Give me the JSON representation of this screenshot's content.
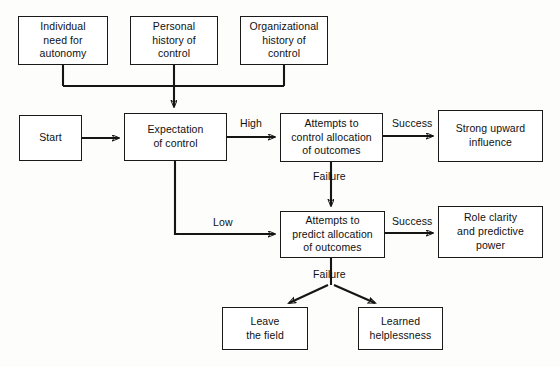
{
  "diagram": {
    "background_color": "#fdfdfc",
    "line_color": "#151515",
    "box_border_color": "#1a1a1a",
    "text_color": "#101010"
  },
  "nodes": [
    {
      "id": "individual-need-autonomy",
      "label": "Individual\nneed for\nautonomy",
      "x": 18,
      "y": 16,
      "w": 90,
      "h": 49,
      "font_size": 10.5
    },
    {
      "id": "personal-history-control",
      "label": "Personal\nhistory of\ncontrol",
      "x": 130,
      "y": 16,
      "w": 88,
      "h": 49,
      "font_size": 10.5
    },
    {
      "id": "organizational-history-control",
      "label": "Organizational\nhistory of\ncontrol",
      "x": 240,
      "y": 16,
      "w": 88,
      "h": 49,
      "font_size": 10.5
    },
    {
      "id": "start",
      "label": "Start",
      "x": 19,
      "y": 115,
      "w": 63,
      "h": 46,
      "font_size": 10.5
    },
    {
      "id": "expectation-of-control",
      "label": "Expectation\nof control",
      "x": 124,
      "y": 113,
      "w": 103,
      "h": 48,
      "font_size": 10.5
    },
    {
      "id": "attempts-control-allocation",
      "label": "Attempts to\ncontrol allocation\nof outcomes",
      "x": 280,
      "y": 113,
      "w": 103,
      "h": 49,
      "font_size": 10.5
    },
    {
      "id": "strong-upward-influence",
      "label": "Strong upward\ninfluence",
      "x": 438,
      "y": 110,
      "w": 105,
      "h": 52,
      "font_size": 10.5
    },
    {
      "id": "attempts-predict-allocation",
      "label": "Attempts to\npredict allocation\nof outcomes",
      "x": 280,
      "y": 211,
      "w": 105,
      "h": 47,
      "font_size": 10.5
    },
    {
      "id": "role-clarity-predictive-power",
      "label": "Role clarity\nand predictive\npower",
      "x": 438,
      "y": 206,
      "w": 105,
      "h": 52,
      "font_size": 10.5
    },
    {
      "id": "leave-the-field",
      "label": "Leave\nthe field",
      "x": 222,
      "y": 307,
      "w": 86,
      "h": 43,
      "font_size": 10.5
    },
    {
      "id": "learned-helplessness",
      "label": "Learned\nhelplessness",
      "x": 358,
      "y": 307,
      "w": 85,
      "h": 43,
      "font_size": 10.5
    }
  ],
  "edge_labels": [
    {
      "id": "high",
      "text": "High",
      "x": 240,
      "y": 117,
      "font_size": 10.5
    },
    {
      "id": "success-upper",
      "text": "Success",
      "x": 392,
      "y": 117,
      "font_size": 10.5
    },
    {
      "id": "failure-upper",
      "text": "Failure",
      "x": 313,
      "y": 170,
      "font_size": 10.5
    },
    {
      "id": "low",
      "text": "Low",
      "x": 213,
      "y": 216,
      "font_size": 10.5
    },
    {
      "id": "success-lower",
      "text": "Success",
      "x": 392,
      "y": 215,
      "font_size": 10.5
    },
    {
      "id": "failure-lower",
      "text": "Failure",
      "x": 313,
      "y": 268,
      "font_size": 10.5
    }
  ],
  "connections": [
    {
      "id": "autonomy-to-bus",
      "from": "individual-need-autonomy",
      "to": "merge-bus"
    },
    {
      "id": "personal-history-to-bus",
      "from": "personal-history-control",
      "to": "merge-bus"
    },
    {
      "id": "organizational-history-to-bus",
      "from": "organizational-history-control",
      "to": "merge-bus"
    },
    {
      "id": "bus-to-expectation",
      "from": "merge-bus",
      "to": "expectation-of-control"
    },
    {
      "id": "start-to-expectation",
      "from": "start",
      "to": "expectation-of-control"
    },
    {
      "id": "expectation-to-control-high",
      "from": "expectation-of-control",
      "to": "attempts-control-allocation",
      "label": "High"
    },
    {
      "id": "control-to-influence-success",
      "from": "attempts-control-allocation",
      "to": "strong-upward-influence",
      "label": "Success"
    },
    {
      "id": "control-to-predict-failure",
      "from": "attempts-control-allocation",
      "to": "attempts-predict-allocation",
      "label": "Failure"
    },
    {
      "id": "expectation-to-predict-low",
      "from": "expectation-of-control",
      "to": "attempts-predict-allocation",
      "label": "Low"
    },
    {
      "id": "predict-to-role-clarity-success",
      "from": "attempts-predict-allocation",
      "to": "role-clarity-predictive-power",
      "label": "Success"
    },
    {
      "id": "predict-to-leave-field-failure",
      "from": "attempts-predict-allocation",
      "to": "leave-the-field",
      "label": "Failure"
    },
    {
      "id": "predict-to-helplessness-failure",
      "from": "attempts-predict-allocation",
      "to": "learned-helplessness",
      "label": "Failure"
    }
  ]
}
